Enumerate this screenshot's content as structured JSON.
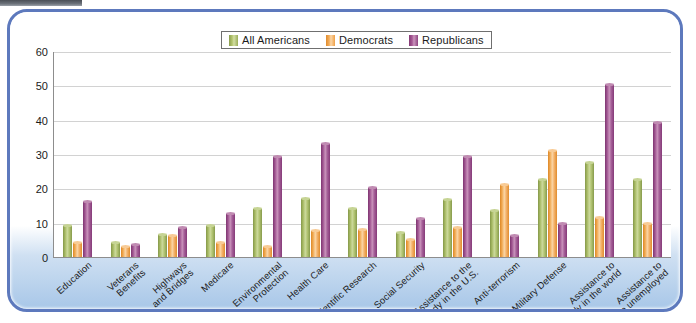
{
  "chart_data": {
    "type": "bar",
    "title": "",
    "xlabel": "",
    "ylabel": "",
    "ylim": [
      0,
      60
    ],
    "yticks": [
      0,
      10,
      20,
      30,
      40,
      50,
      60
    ],
    "grid": true,
    "legend_position": "top-center",
    "categories": [
      "Education",
      "Veterans\nBenefits",
      "Highways\nand Bridges",
      "Medicare",
      "Environmental\nProtection",
      "Health Care",
      "Scientific Research",
      "Social Security",
      "Assistance to the\nneedy in the U.S.",
      "Anti-terrorism",
      "Military Defense",
      "Assistance to\nneedy in the world",
      "Assistance to\nthe unemployed"
    ],
    "series": [
      {
        "name": "All Americans",
        "color": "#a6b962",
        "values": [
          9,
          4,
          6.5,
          9,
          14,
          17,
          14,
          7,
          16.5,
          13.5,
          22.5,
          27.5,
          22.5
        ]
      },
      {
        "name": "Democrats",
        "color": "#f0a850",
        "values": [
          4,
          3,
          6,
          4,
          3,
          7.5,
          8,
          5,
          8.5,
          21,
          31,
          11.5,
          9.5
        ]
      },
      {
        "name": "Republicans",
        "color": "#9f5490",
        "values": [
          16,
          3.5,
          8.5,
          12.5,
          29,
          33,
          20,
          11,
          29,
          6,
          9.5,
          50,
          39
        ]
      }
    ]
  },
  "legend": {
    "items": [
      {
        "label": "All Americans",
        "swatch": "legend-swatch-green"
      },
      {
        "label": "Democrats",
        "swatch": "legend-swatch-orange"
      },
      {
        "label": "Republicans",
        "swatch": "legend-swatch-purple"
      }
    ]
  },
  "colors": {
    "panel_border": "#5d79bd",
    "plot_background": "#ffffff",
    "gridline": "#d2d2d2",
    "axis": "#8d8d8d",
    "series_green": "#a6b962",
    "series_orange": "#f0a850",
    "series_purple": "#9f5490"
  }
}
